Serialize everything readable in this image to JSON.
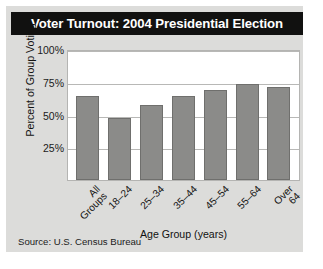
{
  "chart_data": {
    "type": "bar",
    "title": "Voter Turnout: 2004 Presidential Election",
    "categories": [
      "All Groups",
      "18–24",
      "25–34",
      "35–44",
      "45–54",
      "55–64",
      "Over 64"
    ],
    "values": [
      64,
      47,
      57,
      64,
      69,
      73,
      71
    ],
    "xlabel": "Age Group (years)",
    "ylabel": "Percent of Group Voting",
    "ylim": [
      0,
      100
    ],
    "yticks": [
      100,
      75,
      50,
      25
    ],
    "ytick_labels": [
      "100%",
      "75%",
      "50%",
      "25%"
    ],
    "grid": true,
    "legend": "none",
    "source": "Source: U.S. Census Bureau",
    "bar_color": "#8b8b89",
    "title_bar_color": "#111110",
    "panel_color": "#dcdcda",
    "plot_background": "#ffffff"
  }
}
